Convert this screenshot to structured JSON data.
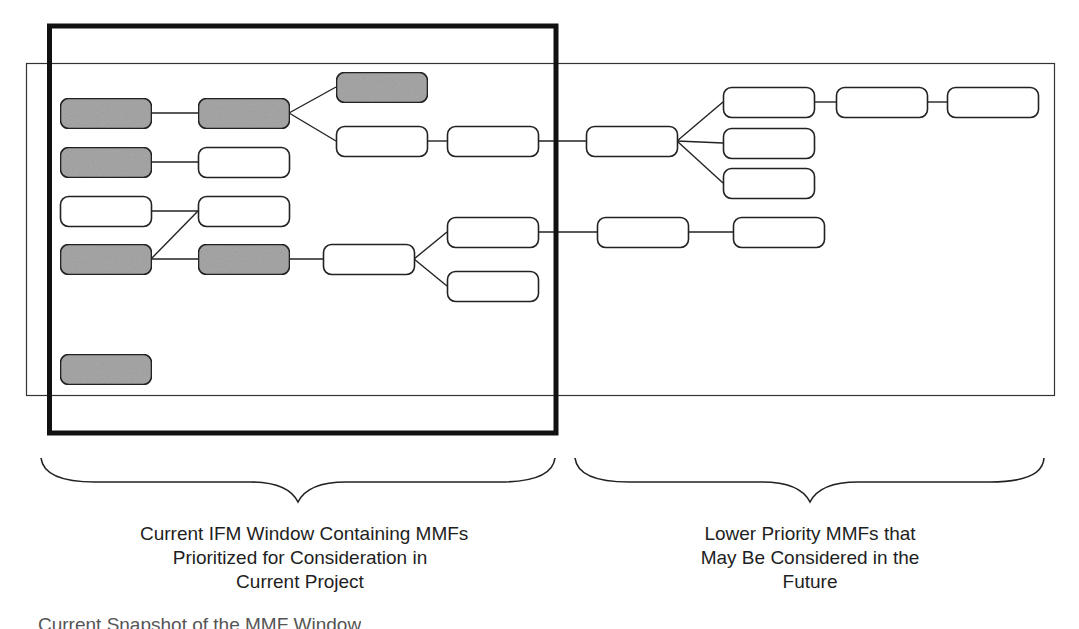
{
  "colors": {
    "stroke": "#222222",
    "prioritized_fill": "#a9a9a9",
    "unprioritized_fill": "#ffffff"
  },
  "regions": {
    "ifm_window": {
      "label": "Current IFM Window"
    },
    "mmf_area": {
      "label": "All MMFs"
    }
  },
  "nodes": [
    {
      "id": "a1",
      "prioritized": true
    },
    {
      "id": "a2",
      "prioritized": true
    },
    {
      "id": "a3",
      "prioritized": false
    },
    {
      "id": "a4",
      "prioritized": true
    },
    {
      "id": "a5",
      "prioritized": true
    },
    {
      "id": "b1",
      "prioritized": true
    },
    {
      "id": "b2",
      "prioritized": false
    },
    {
      "id": "b3",
      "prioritized": false
    },
    {
      "id": "b4",
      "prioritized": true
    },
    {
      "id": "c1",
      "prioritized": true
    },
    {
      "id": "c2",
      "prioritized": false
    },
    {
      "id": "c3",
      "prioritized": false
    },
    {
      "id": "d1",
      "prioritized": false
    },
    {
      "id": "d2",
      "prioritized": false
    },
    {
      "id": "d3",
      "prioritized": false
    },
    {
      "id": "e1",
      "prioritized": false
    },
    {
      "id": "e2",
      "prioritized": false
    },
    {
      "id": "e3",
      "prioritized": false
    },
    {
      "id": "e4",
      "prioritized": false
    },
    {
      "id": "e5",
      "prioritized": false
    },
    {
      "id": "f1",
      "prioritized": false
    },
    {
      "id": "f2",
      "prioritized": false
    }
  ],
  "edges": [
    [
      "a1",
      "b1"
    ],
    [
      "a2",
      "b2"
    ],
    [
      "a3",
      "b3"
    ],
    [
      "a4",
      "b3"
    ],
    [
      "a4",
      "b4"
    ],
    [
      "b1",
      "c1"
    ],
    [
      "b1",
      "c2"
    ],
    [
      "b4",
      "c3"
    ],
    [
      "c2",
      "d1"
    ],
    [
      "c3",
      "d2"
    ],
    [
      "c3",
      "d3"
    ],
    [
      "d1",
      "e1"
    ],
    [
      "d2",
      "e5"
    ],
    [
      "e1",
      "e2"
    ],
    [
      "e1",
      "e3"
    ],
    [
      "e1",
      "e4"
    ],
    [
      "e5",
      "f1"
    ],
    [
      "e2",
      "f2"
    ],
    [
      "f2",
      "f3"
    ]
  ],
  "captions": {
    "left": [
      "Current IFM Window Containing MMFs",
      "Prioritized for Consideration in",
      "Current Project"
    ],
    "right": [
      "Lower Priority MMFs that",
      "May Be Considered in the",
      "Future"
    ],
    "figure": "Current Snapshot of the MMF Window"
  }
}
